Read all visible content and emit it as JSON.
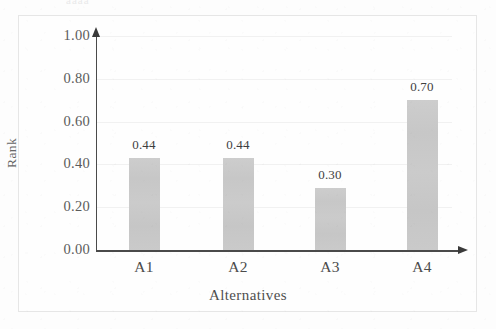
{
  "figure": {
    "top_artifact_text": "aaaa",
    "bar_color": "#c9c9c9",
    "axis_color": "#4a4a4a",
    "gridline_color": "#f1f1f1",
    "border_color": "#e6e6e6",
    "background_color": "#fdfdfd"
  },
  "chart_data": {
    "type": "bar",
    "title": "",
    "subtitle": "",
    "xlabel": "Alternatives",
    "ylabel": "Rank",
    "categories": [
      "A1",
      "A2",
      "A3",
      "A4"
    ],
    "values": [
      0.44,
      0.44,
      0.3,
      0.7
    ],
    "bar_pixel_values": [
      0.43,
      0.43,
      0.29,
      0.7
    ],
    "data_labels": [
      "0.44",
      "0.44",
      "0.30",
      "0.70"
    ],
    "ylim": [
      0.0,
      1.0
    ],
    "ytick_values": [
      1.0,
      0.8,
      0.6,
      0.4,
      0.2,
      0.0
    ],
    "ytick_labels": [
      "1.00",
      "0.80",
      "0.60",
      "0.40",
      "0.20",
      "0.00"
    ],
    "grid": true,
    "grid_axis": "y",
    "legend": false,
    "legend_position": "none",
    "series": [
      {
        "name": "Rank",
        "values": [
          0.44,
          0.44,
          0.3,
          0.7
        ]
      }
    ]
  }
}
